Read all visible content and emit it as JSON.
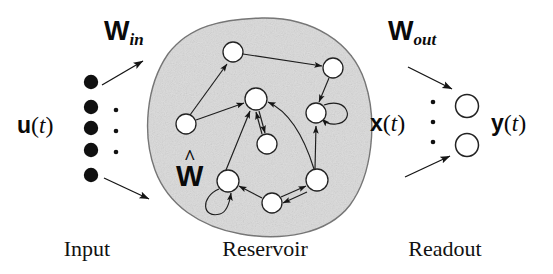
{
  "figure": {
    "background_color": "#ffffff",
    "ink_color": "#0a0a0a",
    "reservoir_fill": "#dcdcdc",
    "reservoir_stroke": "#6b6b6b",
    "node_fill": "#ffffff",
    "node_stroke": "#2a2a2a"
  },
  "labels": {
    "w_in": {
      "base": "W",
      "subscript": "in"
    },
    "w_out": {
      "base": "W",
      "subscript": "out"
    },
    "w_hat": {
      "base": "W",
      "accent": "^"
    },
    "u_of_t": {
      "bold": "u",
      "open": "(",
      "italic": "t",
      "close": ")"
    },
    "x_of_t": {
      "bold": "x",
      "open": "(",
      "italic": "t",
      "close": ")"
    },
    "y_of_t": {
      "bold": "y",
      "open": "(",
      "italic": "t",
      "close": ")"
    }
  },
  "captions": {
    "input": "Input",
    "reservoir": "Reservoir",
    "readout": "Readout"
  },
  "input_layer": {
    "node_count": 5,
    "node_style": "filled",
    "ellipsis_dots": 3,
    "nodes": [
      {
        "cx": 91,
        "cy": 82,
        "r": 7
      },
      {
        "cx": 91,
        "cy": 107,
        "r": 7
      },
      {
        "cx": 91,
        "cy": 128,
        "r": 7
      },
      {
        "cx": 91,
        "cy": 150,
        "r": 7
      },
      {
        "cx": 91,
        "cy": 175,
        "r": 7
      }
    ],
    "dots": [
      {
        "cx": 116,
        "cy": 110,
        "r": 2.2
      },
      {
        "cx": 116,
        "cy": 131,
        "r": 2.2
      },
      {
        "cx": 116,
        "cy": 152,
        "r": 2.2
      }
    ]
  },
  "readout_layer": {
    "node_count": 2,
    "node_style": "open",
    "ellipsis_dots": 3,
    "nodes": [
      {
        "cx": 467,
        "cy": 106,
        "r": 11
      },
      {
        "cx": 467,
        "cy": 145,
        "r": 11
      }
    ],
    "dots": [
      {
        "cx": 433,
        "cy": 102,
        "r": 2.2
      },
      {
        "cx": 433,
        "cy": 122,
        "r": 2.2
      },
      {
        "cx": 433,
        "cy": 142,
        "r": 2.2
      }
    ]
  },
  "reservoir": {
    "blob_path": "M 262 18 C 312 17 352 42 365 82 C 378 122 372 175 350 205 C 327 235 281 241 241 234 C 200 227 168 205 155 170 C 142 134 146 86 168 54 C 189 26 222 19 262 18 Z",
    "node_count": 9,
    "nodes": [
      {
        "id": "n1",
        "label": "top",
        "cx": 233,
        "cy": 52,
        "r": 10
      },
      {
        "id": "n2",
        "label": "top-right",
        "cx": 333,
        "cy": 68,
        "r": 10
      },
      {
        "id": "n3",
        "label": "center",
        "cx": 256,
        "cy": 99,
        "r": 11
      },
      {
        "id": "n4",
        "label": "left",
        "cx": 186,
        "cy": 124,
        "r": 10
      },
      {
        "id": "n5",
        "label": "right-mid",
        "cx": 316,
        "cy": 113,
        "r": 10
      },
      {
        "id": "n6",
        "label": "mid-low",
        "cx": 267,
        "cy": 144,
        "r": 10
      },
      {
        "id": "n7",
        "label": "bottom-left",
        "cx": 228,
        "cy": 181,
        "r": 11
      },
      {
        "id": "n8",
        "label": "bottom-mid",
        "cx": 272,
        "cy": 203,
        "r": 10
      },
      {
        "id": "n9",
        "label": "bottom-right",
        "cx": 317,
        "cy": 180,
        "r": 11
      }
    ],
    "edge_count": 14,
    "self_loops": 2
  },
  "connections": {
    "w_in_arrows": 2,
    "w_out_arrows": 2
  }
}
